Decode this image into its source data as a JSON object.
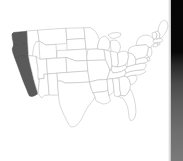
{
  "page": {
    "background_color": "#ffffff",
    "width": 183,
    "height": 161
  },
  "map": {
    "name": "united-states-choropleth",
    "projection_hint": "albers-usa",
    "outline_color": "#b9b9b9",
    "default_fill": "#ffffff",
    "highlight_fill": "#5a5a5a",
    "highlighted_region_label": "West Coast",
    "highlighted_states": [
      "Washington",
      "Oregon",
      "California"
    ],
    "states": [
      {
        "code": "WA",
        "name": "Washington",
        "highlighted": true
      },
      {
        "code": "OR",
        "name": "Oregon",
        "highlighted": true
      },
      {
        "code": "CA",
        "name": "California",
        "highlighted": true
      },
      {
        "code": "ID",
        "name": "Idaho",
        "highlighted": false
      },
      {
        "code": "NV",
        "name": "Nevada",
        "highlighted": false
      },
      {
        "code": "MT",
        "name": "Montana",
        "highlighted": false
      },
      {
        "code": "WY",
        "name": "Wyoming",
        "highlighted": false
      },
      {
        "code": "UT",
        "name": "Utah",
        "highlighted": false
      },
      {
        "code": "AZ",
        "name": "Arizona",
        "highlighted": false
      },
      {
        "code": "CO",
        "name": "Colorado",
        "highlighted": false
      },
      {
        "code": "NM",
        "name": "New Mexico",
        "highlighted": false
      },
      {
        "code": "ND",
        "name": "North Dakota",
        "highlighted": false
      },
      {
        "code": "SD",
        "name": "South Dakota",
        "highlighted": false
      },
      {
        "code": "NE",
        "name": "Nebraska",
        "highlighted": false
      },
      {
        "code": "KS",
        "name": "Kansas",
        "highlighted": false
      },
      {
        "code": "OK",
        "name": "Oklahoma",
        "highlighted": false
      },
      {
        "code": "TX",
        "name": "Texas",
        "highlighted": false
      },
      {
        "code": "MN",
        "name": "Minnesota",
        "highlighted": false
      },
      {
        "code": "IA",
        "name": "Iowa",
        "highlighted": false
      },
      {
        "code": "MO",
        "name": "Missouri",
        "highlighted": false
      },
      {
        "code": "AR",
        "name": "Arkansas",
        "highlighted": false
      },
      {
        "code": "LA",
        "name": "Louisiana",
        "highlighted": false
      },
      {
        "code": "WI",
        "name": "Wisconsin",
        "highlighted": false
      },
      {
        "code": "IL",
        "name": "Illinois",
        "highlighted": false
      },
      {
        "code": "MS",
        "name": "Mississippi",
        "highlighted": false
      },
      {
        "code": "MI",
        "name": "Michigan",
        "highlighted": false
      },
      {
        "code": "IN",
        "name": "Indiana",
        "highlighted": false
      },
      {
        "code": "OH",
        "name": "Ohio",
        "highlighted": false
      },
      {
        "code": "KY",
        "name": "Kentucky",
        "highlighted": false
      },
      {
        "code": "TN",
        "name": "Tennessee",
        "highlighted": false
      },
      {
        "code": "AL",
        "name": "Alabama",
        "highlighted": false
      },
      {
        "code": "GA",
        "name": "Georgia",
        "highlighted": false
      },
      {
        "code": "FL",
        "name": "Florida",
        "highlighted": false
      },
      {
        "code": "SC",
        "name": "South Carolina",
        "highlighted": false
      },
      {
        "code": "NC",
        "name": "North Carolina",
        "highlighted": false
      },
      {
        "code": "VA",
        "name": "Virginia",
        "highlighted": false
      },
      {
        "code": "WV",
        "name": "West Virginia",
        "highlighted": false
      },
      {
        "code": "MD",
        "name": "Maryland",
        "highlighted": false
      },
      {
        "code": "DE",
        "name": "Delaware",
        "highlighted": false
      },
      {
        "code": "PA",
        "name": "Pennsylvania",
        "highlighted": false
      },
      {
        "code": "NJ",
        "name": "New Jersey",
        "highlighted": false
      },
      {
        "code": "NY",
        "name": "New York",
        "highlighted": false
      },
      {
        "code": "CT",
        "name": "Connecticut",
        "highlighted": false
      },
      {
        "code": "RI",
        "name": "Rhode Island",
        "highlighted": false
      },
      {
        "code": "MA",
        "name": "Massachusetts",
        "highlighted": false
      },
      {
        "code": "VT",
        "name": "Vermont",
        "highlighted": false
      },
      {
        "code": "NH",
        "name": "New Hampshire",
        "highlighted": false
      },
      {
        "code": "ME",
        "name": "Maine",
        "highlighted": false
      }
    ]
  },
  "edge_panel": {
    "name": "right-edge-strip",
    "top_color": "#050505",
    "bottom_color": "#7a7a7a",
    "width_px": 12
  }
}
